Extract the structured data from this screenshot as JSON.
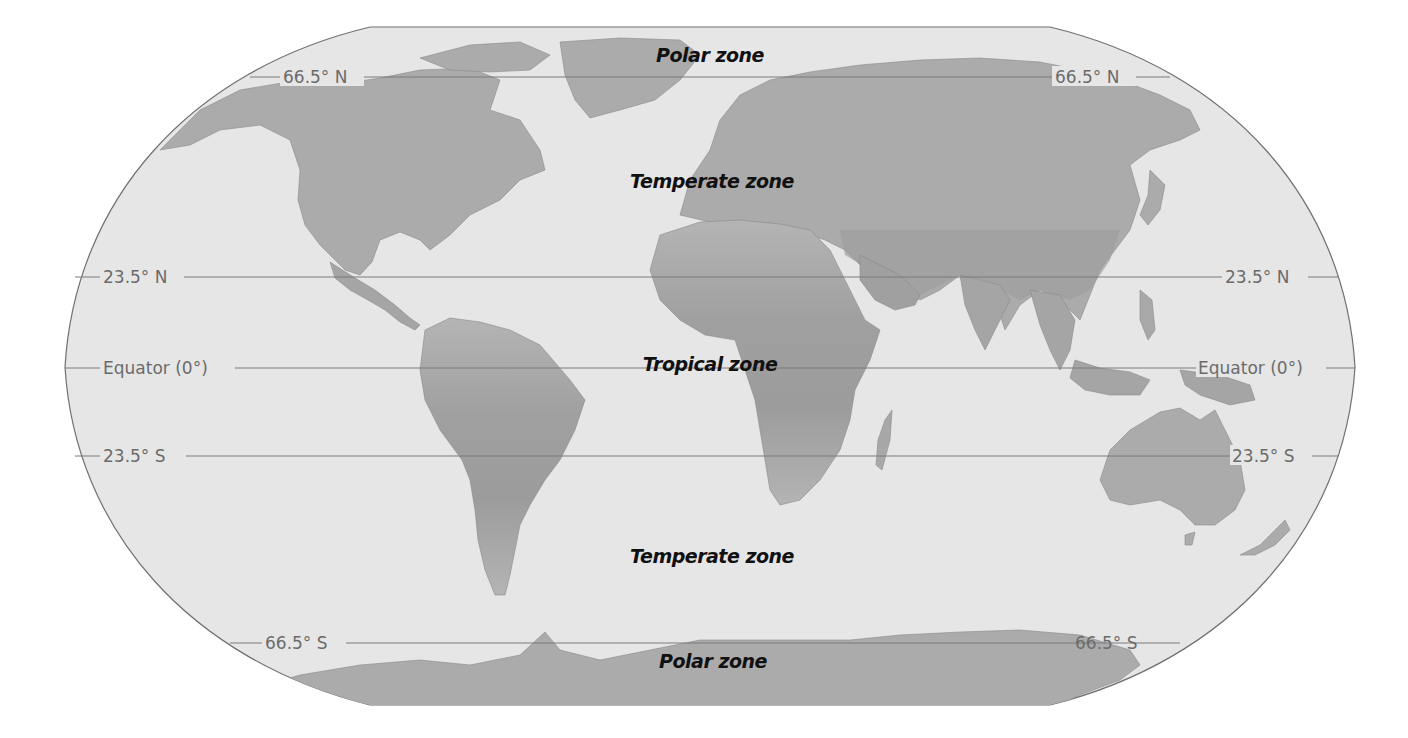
{
  "map": {
    "title": "World climate zones by latitude",
    "projection": "Robinson-style world map",
    "colors": {
      "ocean": "#e6e6e6",
      "land": "#a9a9a9",
      "land_tropical": "#9a9a9a",
      "outline": "#707070",
      "latitude_line": "#7a7a7a",
      "latitude_label": "#6b6b6b",
      "zone_label": "#111111"
    },
    "latitude_lines": [
      {
        "id": "arctic-circle",
        "label": "66.5° N",
        "y": 77
      },
      {
        "id": "tropic-of-cancer",
        "label": "23.5° N",
        "y": 277
      },
      {
        "id": "equator",
        "label": "Equator (0°)",
        "y": 368
      },
      {
        "id": "tropic-of-capricorn",
        "label": "23.5° S",
        "y": 456
      },
      {
        "id": "antarctic-circle",
        "label": "66.5° S",
        "y": 643
      }
    ],
    "zones": [
      {
        "id": "north-polar",
        "label": "Polar zone"
      },
      {
        "id": "north-temperate",
        "label": "Temperate zone"
      },
      {
        "id": "tropical",
        "label": "Tropical zone"
      },
      {
        "id": "south-temperate",
        "label": "Temperate zone"
      },
      {
        "id": "south-polar",
        "label": "Polar zone"
      }
    ],
    "continents": [
      "North America",
      "Greenland",
      "South America",
      "Europe",
      "Africa",
      "Asia",
      "Australia",
      "Antarctica",
      "New Zealand",
      "Madagascar"
    ]
  }
}
